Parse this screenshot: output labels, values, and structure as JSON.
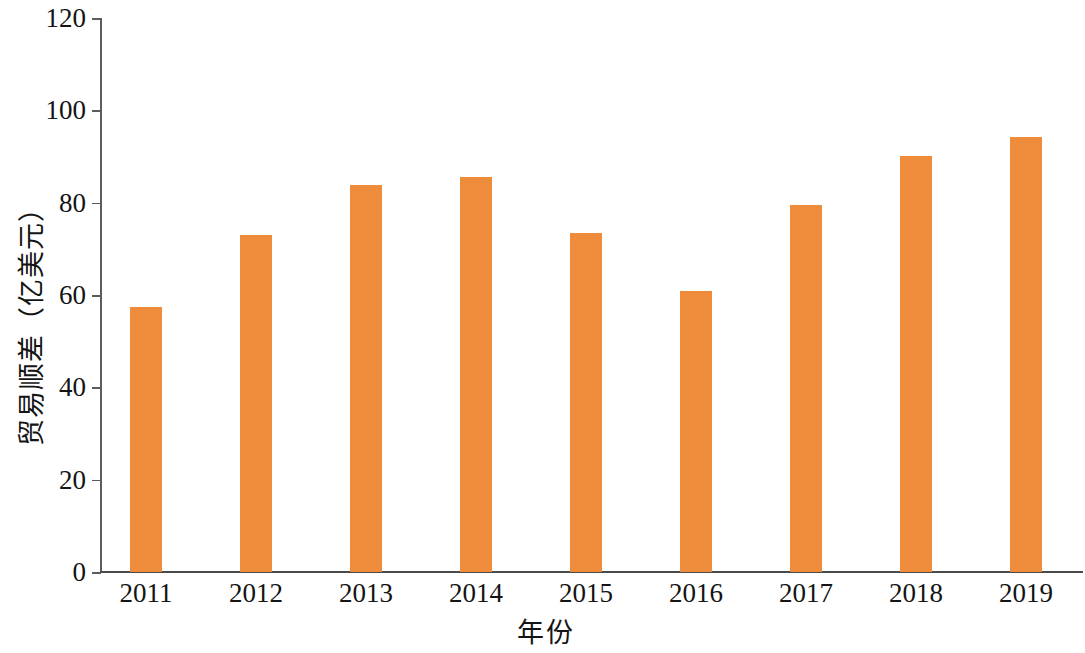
{
  "chart_data": {
    "type": "bar",
    "title": "",
    "subtitle": "",
    "xlabel": "年份",
    "ylabel": "贸易顺差（亿美元）",
    "categories": [
      "2011",
      "2012",
      "2013",
      "2014",
      "2015",
      "2016",
      "2017",
      "2018",
      "2019"
    ],
    "values": [
      57.3,
      73.0,
      83.8,
      85.6,
      73.5,
      60.9,
      79.6,
      90.2,
      94.3
    ],
    "series": [
      {
        "name": "贸易顺差",
        "values": [
          57.3,
          73.0,
          83.8,
          85.6,
          73.5,
          60.9,
          79.6,
          90.2,
          94.3
        ]
      }
    ],
    "ylim": [
      0,
      120
    ],
    "y_ticks": [
      0,
      20,
      40,
      60,
      80,
      100,
      120
    ],
    "y_tick_labels": [
      "0",
      "20",
      "40",
      "60",
      "80",
      "100",
      "120"
    ],
    "grid": false,
    "legend": false,
    "legend_position": "none",
    "bar_color": "#ee8c3c",
    "axis_color": "#5c5c5c",
    "text_color": "#141414"
  }
}
